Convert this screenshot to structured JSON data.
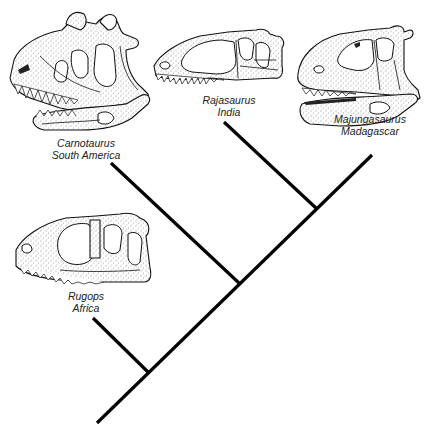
{
  "diagram": {
    "type": "cladogram",
    "style": {
      "line_color": "#000000",
      "text_color": "#222222",
      "background": "#ffffff"
    },
    "taxa": [
      {
        "id": "carnotaurus",
        "genus": "Carnotaurus",
        "region": "South America"
      },
      {
        "id": "rajasaurus",
        "genus": "Rajasaurus",
        "region": "India"
      },
      {
        "id": "majungasaurus",
        "genus": "Majungasaurus",
        "region": "Madagascar"
      },
      {
        "id": "rugops",
        "genus": "Rugops",
        "region": "Africa"
      }
    ],
    "tree": {
      "root": [
        97,
        423
      ],
      "trunk_end": [
        372,
        155
      ],
      "nodes": [
        {
          "id": "node-rugops",
          "at": [
            149,
            373
          ],
          "branch_tip": [
            93,
            318
          ],
          "leaf": "rugops"
        },
        {
          "id": "node-carnotaurus",
          "at": [
            239,
            283
          ],
          "branch_tip": [
            111,
            163
          ],
          "leaf": "carnotaurus"
        },
        {
          "id": "node-rajasaurus",
          "at": [
            317,
            209
          ],
          "branch_tip": [
            224,
            122
          ],
          "leaf": "rajasaurus"
        }
      ],
      "trunk_leaf": "majungasaurus"
    }
  }
}
